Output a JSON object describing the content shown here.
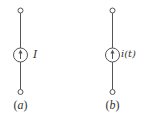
{
  "diagrams": [
    {
      "id": "a",
      "source_label": "I",
      "caption": "(a)",
      "caption_var": "a"
    },
    {
      "id": "b",
      "source_label": "i(t)",
      "caption": "(b)",
      "caption_var": "b"
    }
  ],
  "colors": {
    "stroke": "#555555",
    "background": "#ffffff"
  }
}
